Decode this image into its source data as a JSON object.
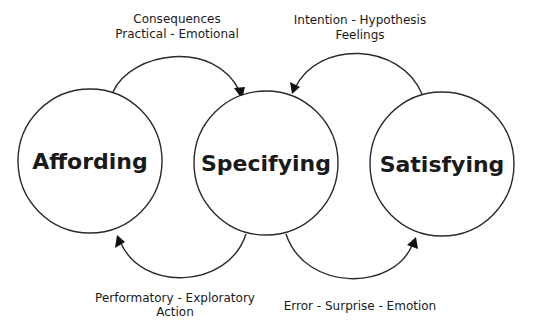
{
  "diagram": {
    "type": "cycle-flow",
    "nodes": [
      {
        "id": "affording",
        "label": "Affording",
        "cx": 90,
        "cy": 161,
        "r": 72
      },
      {
        "id": "specifying",
        "label": "Specifying",
        "cx": 266,
        "cy": 163,
        "r": 72
      },
      {
        "id": "satisfying",
        "label": "Satisfying",
        "cx": 442,
        "cy": 164,
        "r": 72
      }
    ],
    "edges": [
      {
        "id": "affording-to-specifying",
        "from": "affording",
        "to": "specifying",
        "position": "top-left",
        "label_lines": [
          "Consequences",
          "Practical - Emotional"
        ]
      },
      {
        "id": "satisfying-to-specifying",
        "from": "satisfying",
        "to": "specifying",
        "position": "top-right",
        "label_lines": [
          "Intention - Hypothesis",
          "Feelings"
        ]
      },
      {
        "id": "specifying-to-affording",
        "from": "specifying",
        "to": "affording",
        "position": "bottom-left",
        "label_lines": [
          "Performatory - Exploratory",
          "Action"
        ]
      },
      {
        "id": "specifying-to-satisfying",
        "from": "specifying",
        "to": "satisfying",
        "position": "bottom-right",
        "label_lines": [
          "Error - Surprise - Emotion"
        ]
      }
    ]
  },
  "colors": {
    "stroke": "#2a2a2a",
    "text": "#1a1a1a",
    "background": "#ffffff"
  }
}
